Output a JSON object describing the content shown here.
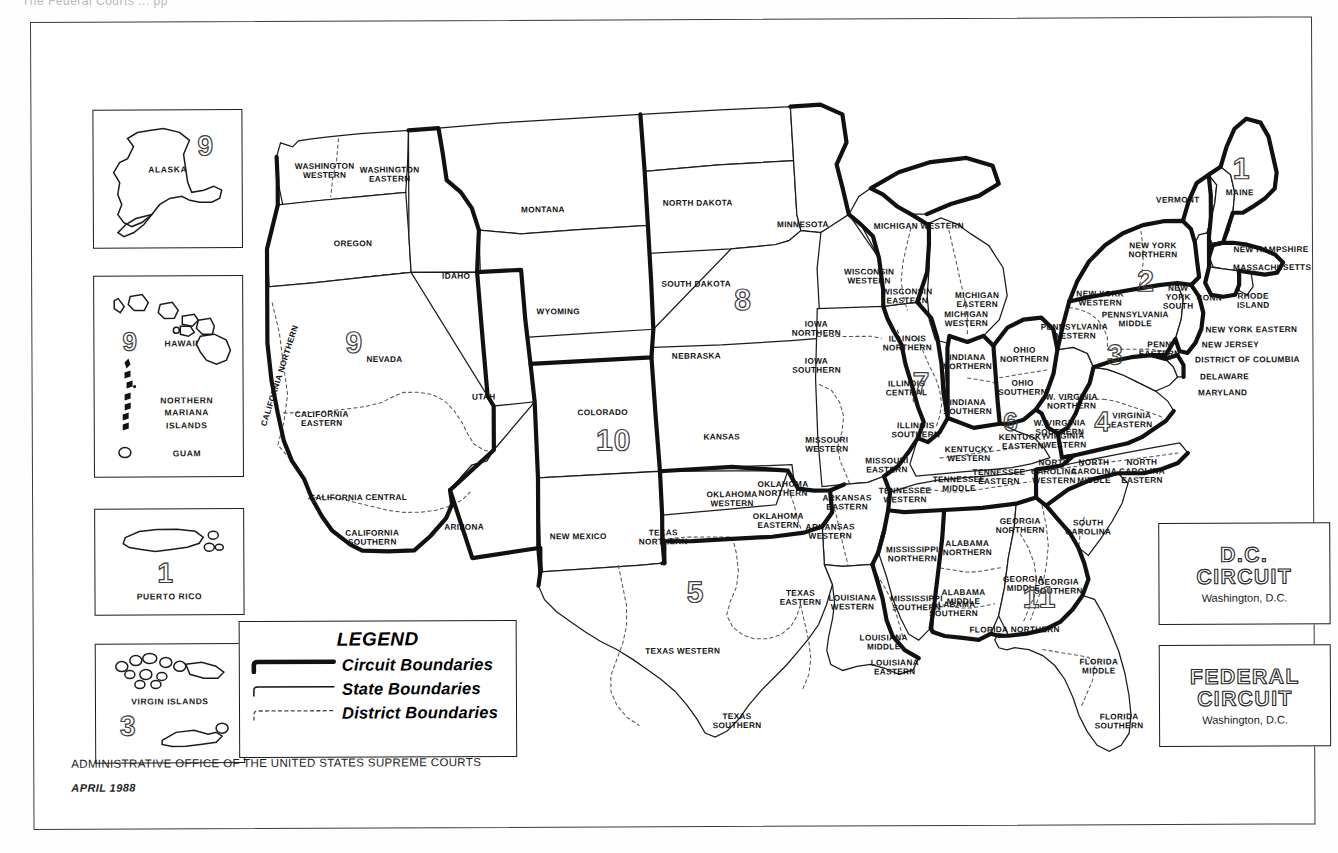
{
  "page": {
    "cut_off_header": "The Federal Courts ... pp",
    "footer_line1": "ADMINISTRATIVE OFFICE OF THE UNITED STATES SUPREME COURTS",
    "footer_line2": "APRIL 1988"
  },
  "legend": {
    "title": "LEGEND",
    "items": [
      {
        "label": "Circuit Boundaries",
        "style": "thick-solid"
      },
      {
        "label": "State Boundaries",
        "style": "thin-solid"
      },
      {
        "label": "District Boundaries",
        "style": "dotted"
      }
    ]
  },
  "insets": [
    {
      "name": "alaska",
      "label": "ALASKA",
      "circuit": "9",
      "x": 62,
      "y": 88,
      "w": 148,
      "h": 137
    },
    {
      "name": "pacific",
      "label": "HAWAII",
      "circuit": "9",
      "secondary": [
        "NORTHERN\nMARIANA\nISLANDS",
        "GUAM"
      ],
      "x": 62,
      "y": 254,
      "w": 148,
      "h": 200
    },
    {
      "name": "puerto-rico",
      "label": "PUERTO RICO",
      "circuit": "1",
      "x": 62,
      "y": 487,
      "w": 148,
      "h": 105
    },
    {
      "name": "virgin-islands",
      "label": "VIRGIN ISLANDS",
      "circuit": "3",
      "x": 62,
      "y": 622,
      "w": 148,
      "h": 118
    }
  ],
  "circuit_boxes": [
    {
      "name": "dc-circuit",
      "line1": "D.C.",
      "line2": "CIRCUIT",
      "sub": "Washington, D.C.",
      "x": 1126,
      "y": 506,
      "w": 170,
      "h": 100
    },
    {
      "name": "federal-circuit",
      "line1": "FEDERAL",
      "line2": "CIRCUIT",
      "sub": "Washington, D.C.",
      "x": 1126,
      "y": 628,
      "w": 170,
      "h": 100
    }
  ],
  "circuit_numbers_on_map": [
    {
      "n": "1",
      "x": 1212,
      "y": 152,
      "size": 30
    },
    {
      "n": "2",
      "x": 1116,
      "y": 264,
      "size": 30
    },
    {
      "n": "3",
      "x": 1085,
      "y": 338,
      "size": 28
    },
    {
      "n": "4",
      "x": 1072,
      "y": 405,
      "size": 28
    },
    {
      "n": "5",
      "x": 664,
      "y": 573,
      "size": 30
    },
    {
      "n": "6",
      "x": 980,
      "y": 404,
      "size": 26
    },
    {
      "n": "7",
      "x": 891,
      "y": 365,
      "size": 30
    },
    {
      "n": "8",
      "x": 713,
      "y": 281,
      "size": 30
    },
    {
      "n": "9",
      "x": 324,
      "y": 322,
      "size": 30
    },
    {
      "n": "10",
      "x": 574,
      "y": 421,
      "size": 30
    },
    {
      "n": "11",
      "x": 1000,
      "y": 580,
      "size": 30
    }
  ],
  "map_labels": [
    {
      "t": "WASHINGTON\nWESTERN",
      "x": 294,
      "y": 151
    },
    {
      "t": "WASHINGTON\nEASTERN",
      "x": 359,
      "y": 155
    },
    {
      "t": "OREGON",
      "x": 322,
      "y": 224
    },
    {
      "t": "IDAHO",
      "x": 425,
      "y": 257
    },
    {
      "t": "MONTANA",
      "x": 512,
      "y": 191
    },
    {
      "t": "NORTH DAKOTA",
      "x": 667,
      "y": 185
    },
    {
      "t": "SOUTH DAKOTA",
      "x": 665,
      "y": 266
    },
    {
      "t": "MINNESOTA",
      "x": 772,
      "y": 207
    },
    {
      "t": "WYOMING",
      "x": 527,
      "y": 293
    },
    {
      "t": "NEBRASKA",
      "x": 665,
      "y": 338
    },
    {
      "t": "NEVADA",
      "x": 353,
      "y": 340
    },
    {
      "t": "UTAH",
      "x": 452,
      "y": 378
    },
    {
      "t": "COLORADO",
      "x": 571,
      "y": 394
    },
    {
      "t": "KANSAS",
      "x": 690,
      "y": 419
    },
    {
      "t": "CALIFORNIA\nEASTERN",
      "x": 290,
      "y": 399
    },
    {
      "t": "CALIFORNIA CENTRAL",
      "x": 326,
      "y": 478
    },
    {
      "t": "CALIFORNIA\nSOUTHERN",
      "x": 340,
      "y": 518
    },
    {
      "t": "ARIZONA",
      "x": 432,
      "y": 508
    },
    {
      "t": "NEW MEXICO",
      "x": 546,
      "y": 518
    },
    {
      "t": "IOWA\nNORTHERN",
      "x": 785,
      "y": 311
    },
    {
      "t": "IOWA\nSOUTHERN",
      "x": 785,
      "y": 348
    },
    {
      "t": "MISSOURI\nWESTERN",
      "x": 795,
      "y": 427
    },
    {
      "t": "MISSOURI\nEASTERN",
      "x": 855,
      "y": 448
    },
    {
      "t": "ILLINOIS\nNORTHERN",
      "x": 876,
      "y": 326
    },
    {
      "t": "ILLINOIS\nCENTRAL",
      "x": 875,
      "y": 371
    },
    {
      "t": "ILLINOIS\nSOUTHERN",
      "x": 884,
      "y": 413
    },
    {
      "t": "WISCONSIN\nWESTERN",
      "x": 838,
      "y": 259
    },
    {
      "t": "WISCONSIN\nEASTERN",
      "x": 876,
      "y": 279
    },
    {
      "t": "MICHIGAN WESTERN",
      "x": 888,
      "y": 209
    },
    {
      "t": "MICHIGAN\nEASTERN",
      "x": 946,
      "y": 283
    },
    {
      "t": "MICHIGAN\nWESTERN",
      "x": 935,
      "y": 302
    },
    {
      "t": "INDIANA\nNORTHERN",
      "x": 936,
      "y": 345
    },
    {
      "t": "INDIANA\nSOUTHERN",
      "x": 936,
      "y": 390
    },
    {
      "t": "OHIO\nNORTHERN",
      "x": 993,
      "y": 338
    },
    {
      "t": "OHIO\nSOUTHERN",
      "x": 991,
      "y": 371
    },
    {
      "t": "KENTUCKY\nWESTERN",
      "x": 937,
      "y": 437
    },
    {
      "t": "KENTUCKY\nEASTERN",
      "x": 991,
      "y": 425
    },
    {
      "t": "TENNESSEE\nWESTERN",
      "x": 873,
      "y": 478
    },
    {
      "t": "TENNESSEE\nMIDDLE",
      "x": 927,
      "y": 467
    },
    {
      "t": "TENNESSEE\nEASTERN",
      "x": 967,
      "y": 460
    },
    {
      "t": "OKLAHOMA\nNORTHERN",
      "x": 751,
      "y": 471
    },
    {
      "t": "OKLAHOMA\nWESTERN",
      "x": 700,
      "y": 481
    },
    {
      "t": "OKLAHOMA\nEASTERN",
      "x": 746,
      "y": 503
    },
    {
      "t": "ARKANSAS\nEASTERN",
      "x": 815,
      "y": 485
    },
    {
      "t": "ARKANSAS\nWESTERN",
      "x": 798,
      "y": 514
    },
    {
      "t": "TEXAS\nNORTHERN",
      "x": 631,
      "y": 519
    },
    {
      "t": "TEXAS\nEASTERN",
      "x": 768,
      "y": 580
    },
    {
      "t": "TEXAS WESTERN",
      "x": 650,
      "y": 633
    },
    {
      "t": "TEXAS\nSOUTHERN",
      "x": 704,
      "y": 703
    },
    {
      "t": "LOUISIANA\nWESTERN",
      "x": 820,
      "y": 585
    },
    {
      "t": "LOUISIANA\nMIDDLE",
      "x": 851,
      "y": 625
    },
    {
      "t": "LOUISIANA\nEASTERN",
      "x": 862,
      "y": 650
    },
    {
      "t": "MISSISSIPPI\nNORTHERN",
      "x": 880,
      "y": 537
    },
    {
      "t": "MISSISSIPPI\nSOUTHERN",
      "x": 884,
      "y": 586
    },
    {
      "t": "ALABAMA\nNORTHERN",
      "x": 935,
      "y": 531
    },
    {
      "t": "ALABAMA\nMIDDLE",
      "x": 931,
      "y": 580
    },
    {
      "t": "ALABAMA\nSOUTHERN",
      "x": 921,
      "y": 592
    },
    {
      "t": "GEORGIA\nNORTHERN",
      "x": 988,
      "y": 509
    },
    {
      "t": "GEORGIA\nMIDDLE",
      "x": 991,
      "y": 567
    },
    {
      "t": "GEORGIA\nSOUTHERN",
      "x": 1026,
      "y": 570
    },
    {
      "t": "SOUTH\nCAROLINA",
      "x": 1056,
      "y": 511
    },
    {
      "t": "NORTH\nCAROLINA\nMIDDLE",
      "x": 1062,
      "y": 455
    },
    {
      "t": "NORTH\nCAROLINA\nEASTERN",
      "x": 1110,
      "y": 455
    },
    {
      "t": "NORTH\nCAROLINA\nWESTERN",
      "x": 1022,
      "y": 455
    },
    {
      "t": "VIRGINIA\nWESTERN",
      "x": 1033,
      "y": 424
    },
    {
      "t": "VIRGINIA\nEASTERN",
      "x": 1100,
      "y": 404
    },
    {
      "t": "W. VIRGINIA\nNORTHERN",
      "x": 1040,
      "y": 385
    },
    {
      "t": "W. VIRGINIA\nSOUTHERN",
      "x": 1028,
      "y": 411
    },
    {
      "t": "FLORIDA NORTHERN",
      "x": 982,
      "y": 613
    },
    {
      "t": "FLORIDA\nMIDDLE",
      "x": 1066,
      "y": 650
    },
    {
      "t": "FLORIDA\nSOUTHERN",
      "x": 1086,
      "y": 705
    },
    {
      "t": "PENNSYLVANIA\nWESTERN",
      "x": 1043,
      "y": 315
    },
    {
      "t": "PENNSYLVANIA\nMIDDLE",
      "x": 1104,
      "y": 303
    },
    {
      "t": "PENN\nEASTERN",
      "x": 1128,
      "y": 333
    },
    {
      "t": "NEW YORK\nWESTERN",
      "x": 1069,
      "y": 282
    },
    {
      "t": "NEW YORK\nNORTHERN",
      "x": 1122,
      "y": 234
    },
    {
      "t": "NEW\nYORK\nSOUTH",
      "x": 1147,
      "y": 281
    },
    {
      "t": "NEW YORK EASTERN",
      "x": 1220,
      "y": 314
    },
    {
      "t": "CONN",
      "x": 1178,
      "y": 282
    },
    {
      "t": "RHODE\nISLAND",
      "x": 1222,
      "y": 285
    },
    {
      "t": "MASSACHUSETTS",
      "x": 1241,
      "y": 252
    },
    {
      "t": "NEW HAMPSHIRE",
      "x": 1240,
      "y": 234
    },
    {
      "t": "VERMONT",
      "x": 1147,
      "y": 184
    },
    {
      "t": "MAINE",
      "x": 1209,
      "y": 177
    },
    {
      "t": "NEW JERSEY",
      "x": 1199,
      "y": 329
    },
    {
      "t": "DISTRICT OF COLUMBIA",
      "x": 1216,
      "y": 344
    },
    {
      "t": "DELAWARE",
      "x": 1193,
      "y": 361
    },
    {
      "t": "MARYLAND",
      "x": 1191,
      "y": 377
    }
  ],
  "rotated_labels": [
    {
      "t": "CALIFORNIA\nNORTHERN",
      "x": 249,
      "y": 355,
      "rot": -72
    }
  ]
}
